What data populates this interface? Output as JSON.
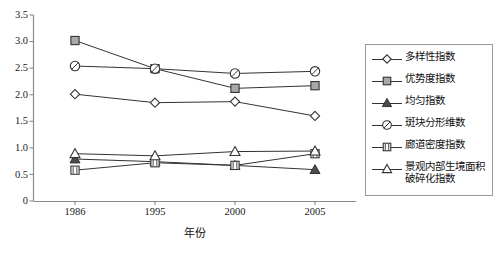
{
  "chart_data": {
    "type": "line",
    "title": "",
    "xlabel": "年份",
    "ylabel": "",
    "categories": [
      "1986",
      "1995",
      "2000",
      "2005"
    ],
    "x_tick_labels": [
      "1986",
      "1995",
      "2000",
      "2005"
    ],
    "y_tick_labels": [
      "0",
      "0.5",
      "1.0",
      "1.5",
      "2.0",
      "2.5",
      "3.0",
      "3.5"
    ],
    "y_ticks": [
      0,
      0.5,
      1.0,
      1.5,
      2.0,
      2.5,
      3.0,
      3.5
    ],
    "ylim": [
      0,
      3.5
    ],
    "grid": false,
    "legend_position": "right",
    "series": [
      {
        "name": "多样性指数",
        "marker": "open-diamond",
        "values": [
          2.01,
          1.85,
          1.87,
          1.6
        ]
      },
      {
        "name": "优势度指数",
        "marker": "filled-square",
        "values": [
          3.02,
          2.49,
          2.12,
          2.17
        ]
      },
      {
        "name": "均匀指数",
        "marker": "filled-triangle",
        "values": [
          0.79,
          0.74,
          0.67,
          0.59
        ]
      },
      {
        "name": "斑块分形维数",
        "marker": "slashed-circle",
        "values": [
          2.54,
          2.49,
          2.4,
          2.44
        ]
      },
      {
        "name": "廊道密度指数",
        "marker": "hatched-square",
        "values": [
          0.58,
          0.72,
          0.67,
          0.89
        ]
      },
      {
        "name": "景观内部生境面积破碎化指数",
        "marker": "open-triangle",
        "values": [
          0.89,
          0.85,
          0.93,
          0.94
        ]
      }
    ]
  },
  "legend": {
    "entries": [
      {
        "label": "多样性指数",
        "label2": ""
      },
      {
        "label": "优势度指数",
        "label2": ""
      },
      {
        "label": "均匀指数",
        "label2": ""
      },
      {
        "label": "斑块分形维数",
        "label2": ""
      },
      {
        "label": "廊道密度指数",
        "label2": ""
      },
      {
        "label": "景观内部生境面积",
        "label2": "破碎化指数"
      }
    ]
  },
  "colors": {
    "line": "#333333",
    "marker_fill_gray": "#a8a8a8",
    "marker_fill_white": "#ffffff",
    "axis": "#808080",
    "text": "#111111",
    "legend_border": "#9a9a9a",
    "background": "#ffffff"
  }
}
